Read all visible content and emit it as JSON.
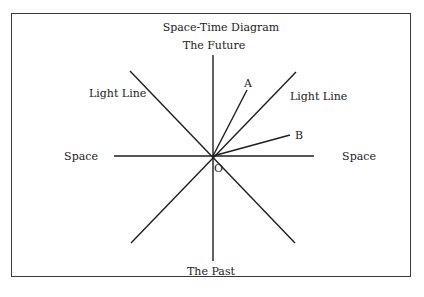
{
  "diagram": {
    "title": "Space-Time Diagram",
    "labels": {
      "future": "The Future",
      "past": "The Past",
      "space_left": "Space",
      "space_right": "Space",
      "light_line_left": "Light Line",
      "light_line_right": "Light Line",
      "event_a": "A",
      "event_b": "B",
      "origin": "O"
    },
    "colors": {
      "line": "#1e1e1e",
      "text": "#222222",
      "border": "#3a3a3a",
      "background": "#ffffff"
    },
    "nodes": [
      {
        "id": "O",
        "label": "O",
        "x": 213,
        "y": 156
      },
      {
        "id": "A",
        "label": "A",
        "x": 247,
        "y": 90
      },
      {
        "id": "B",
        "label": "B",
        "x": 290,
        "y": 135
      }
    ],
    "edges": [
      {
        "name": "time-axis",
        "from": [
          213,
          55
        ],
        "to": [
          213,
          261
        ]
      },
      {
        "name": "space-axis",
        "from": [
          114,
          156
        ],
        "to": [
          314,
          156
        ]
      },
      {
        "name": "light-line-left",
        "from": [
          130,
          71
        ],
        "to": [
          295,
          243
        ]
      },
      {
        "name": "light-line-right",
        "from": [
          296,
          72
        ],
        "to": [
          131,
          243
        ]
      },
      {
        "name": "worldline-a",
        "from": [
          213,
          156
        ],
        "to": [
          247,
          90
        ]
      },
      {
        "name": "worldline-b",
        "from": [
          213,
          156
        ],
        "to": [
          290,
          135
        ]
      }
    ]
  }
}
